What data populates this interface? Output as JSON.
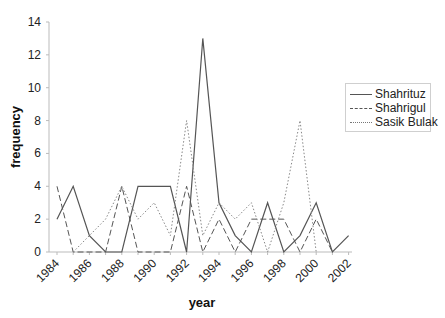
{
  "chart_data": {
    "type": "line",
    "title": "",
    "xlabel": "year",
    "ylabel": "frequency",
    "ylim": [
      0,
      14
    ],
    "yticks": [
      0,
      2,
      4,
      6,
      8,
      10,
      12,
      14
    ],
    "xtick_labels": [
      "1984",
      "1986",
      "1988",
      "1990",
      "1992",
      "1994",
      "1996",
      "1998",
      "2000",
      "2002"
    ],
    "x": [
      1984,
      1985,
      1986,
      1987,
      1988,
      1989,
      1990,
      1991,
      1992,
      1993,
      1994,
      1995,
      1996,
      1997,
      1998,
      1999,
      2000,
      2001,
      2002
    ],
    "series": [
      {
        "name": "Shahrituz",
        "style": "solid",
        "values": [
          2,
          4,
          1,
          0,
          0,
          4,
          4,
          4,
          0,
          13,
          3,
          1,
          0,
          3,
          0,
          1,
          3,
          0,
          1
        ]
      },
      {
        "name": "Shahrigul",
        "style": "dashed",
        "values": [
          4,
          0,
          0,
          0,
          4,
          0,
          0,
          0,
          4,
          0,
          2,
          0,
          2,
          2,
          2,
          0,
          2,
          0,
          null
        ]
      },
      {
        "name": "Sasik Bulak",
        "style": "dotted",
        "values": [
          null,
          0,
          1,
          2,
          4,
          2,
          3,
          1,
          8,
          1,
          3,
          2,
          3,
          0,
          3,
          8,
          0,
          null,
          null
        ]
      }
    ],
    "legend_position": "right",
    "grid": false
  },
  "legend": {
    "items": [
      {
        "label": "Shahrituz"
      },
      {
        "label": "Shahrigul"
      },
      {
        "label": "Sasik Bulak"
      }
    ]
  },
  "axes": {
    "xlabel": "year",
    "ylabel": "frequency"
  }
}
